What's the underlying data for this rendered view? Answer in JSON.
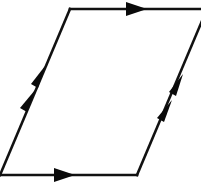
{
  "diagram": {
    "type": "parallelogram-identification",
    "description": "Parallelogram with oriented edges: single arrows on horizontal edges, double arrows on slanted edges",
    "colors": {
      "line": "#111111",
      "arrow": "#0a0a0a",
      "background": "#ffffff"
    },
    "vertices": {
      "bottom_left": [
        0,
        175
      ],
      "bottom_right": [
        137,
        175
      ],
      "top_right": [
        207,
        9
      ],
      "top_left": [
        70,
        9
      ]
    },
    "edges": [
      {
        "name": "bottom",
        "from": "bottom_left",
        "to": "bottom_right",
        "arrows": 1,
        "direction": "right"
      },
      {
        "name": "top",
        "from": "top_left",
        "to": "top_right",
        "arrows": 1,
        "direction": "right"
      },
      {
        "name": "left",
        "from": "bottom_left",
        "to": "top_left",
        "arrows": 2,
        "direction": "up"
      },
      {
        "name": "right",
        "from": "bottom_right",
        "to": "top_right",
        "arrows": 2,
        "direction": "up"
      }
    ]
  }
}
